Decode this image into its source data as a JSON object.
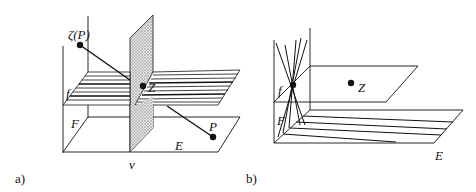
{
  "figure": {
    "panel_a": {
      "caption": "a)",
      "labels": {
        "zeta_p": "ζ(P)",
        "f": "f",
        "z": "Z",
        "F": "F",
        "P": "P",
        "E": "E",
        "v": "v"
      }
    },
    "panel_b": {
      "caption": "b)",
      "labels": {
        "f": "f",
        "z": "Z",
        "F": "F",
        "E": "E"
      }
    }
  },
  "colors": {
    "line": "#111111",
    "shade": "#c8c8c8",
    "background": "#ffffff"
  }
}
